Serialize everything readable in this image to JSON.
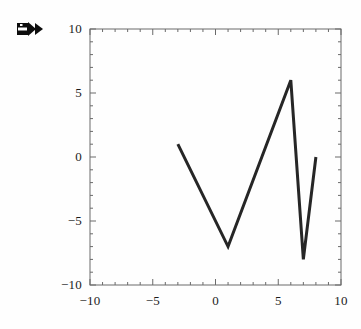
{
  "cell": {
    "marker_icon": "output-cell-arrow-icon"
  },
  "chart_data": {
    "type": "line",
    "title": "",
    "xlabel": "",
    "ylabel": "",
    "xlim": [
      -10,
      10
    ],
    "ylim": [
      -10,
      10
    ],
    "grid": false,
    "legend": null,
    "frame": true,
    "x_ticks": [
      -10,
      -5,
      0,
      5,
      10
    ],
    "y_ticks": [
      10,
      5,
      0,
      -5,
      -10
    ],
    "x_tick_labels": [
      "-10",
      "-5",
      "0",
      "5",
      "10"
    ],
    "y_tick_labels": [
      "10",
      "5",
      "0",
      "-5",
      "-10"
    ],
    "x_minor_step": 1,
    "y_minor_step": 1,
    "line_color": "#262626",
    "line_width": 3,
    "series": [
      {
        "name": "data",
        "x": [
          -3,
          1,
          6,
          7,
          8
        ],
        "y": [
          1,
          -7,
          6,
          -8,
          0
        ]
      }
    ]
  }
}
